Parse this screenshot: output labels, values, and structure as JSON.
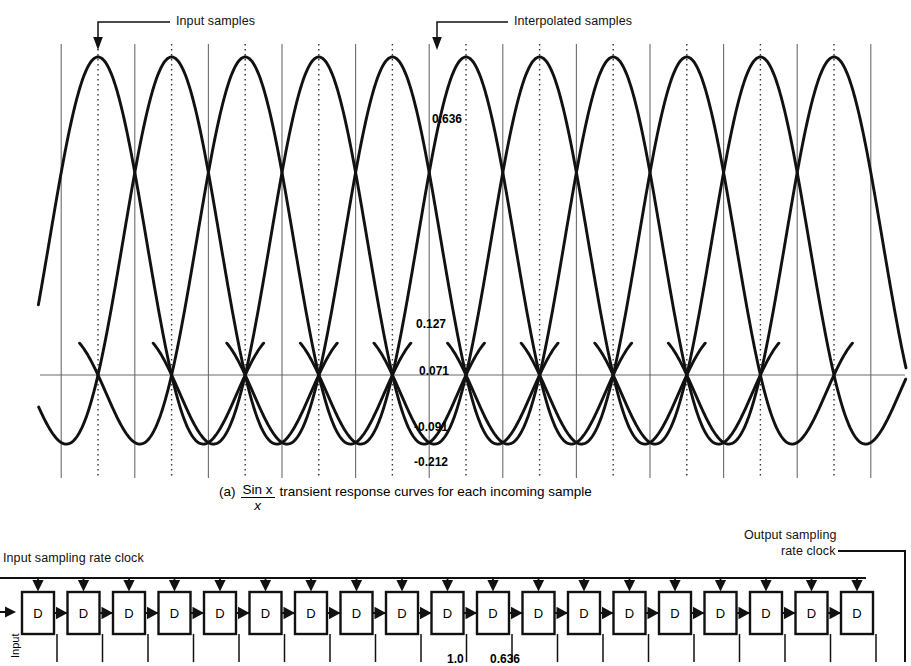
{
  "figure": {
    "annotations": {
      "input_samples": "Input samples",
      "interpolated_samples": "Interpolated samples"
    },
    "value_labels": [
      {
        "text": "0.636",
        "value": 0.636
      },
      {
        "text": "0.127",
        "value": 0.127
      },
      {
        "text": "0.071",
        "value": 0.071
      },
      {
        "text": "-0.091",
        "value": -0.091
      },
      {
        "text": "-0.212",
        "value": -0.212
      }
    ],
    "caption": {
      "index": "(a)",
      "numerator": "Sin x",
      "denominator": "x",
      "rest": "transient response curves for each incoming sample"
    }
  },
  "block_diagram": {
    "input_clock_label": "Input sampling rate clock",
    "output_clock_label_line1": "Output sampling",
    "output_clock_label_line2": "rate clock",
    "register_label": "D",
    "register_count": 19,
    "left_side_label": "Input",
    "bottom_values": [
      "1.0",
      "0.636"
    ]
  },
  "chart_data": {
    "type": "line",
    "xlabel": "",
    "ylabel": "",
    "grid": true,
    "legend": "none",
    "ylim": [
      -0.3,
      1.0
    ],
    "kernel_sample_values": {
      "main_lobe_peak": 1.0,
      "at_half_sample_offset": 0.636,
      "sidelobe_positive_1": 0.127,
      "sidelobe_positive_2": 0.071,
      "sidelobe_negative_1": -0.091,
      "sidelobe_negative_2": -0.212
    },
    "x_grid_lines": {
      "dotted_positions_label": "input sample instants",
      "solid_positions_label": "interpolated sample instants",
      "spacing_px": 36.8,
      "first_dotted_px": 98,
      "count_dotted": 11,
      "count_solid": 11
    },
    "curves_drawn": 11,
    "axis_baseline_label": "0"
  }
}
